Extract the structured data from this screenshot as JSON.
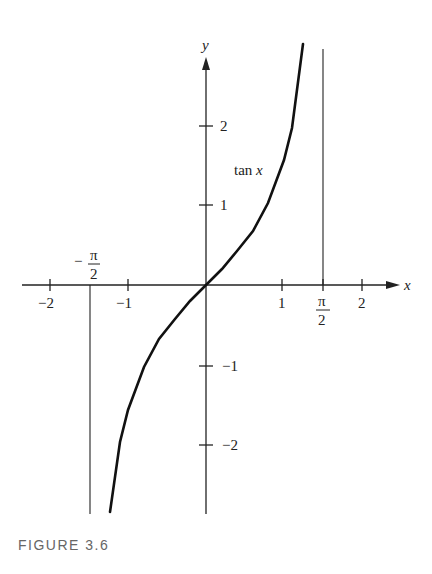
{
  "caption": "FIGURE 3.6",
  "axes": {
    "x_label": "x",
    "y_label": "y",
    "x_ticks": [
      {
        "value": -2,
        "label": "−2"
      },
      {
        "value": -1,
        "label": "−1"
      },
      {
        "value": 1,
        "label": "1"
      },
      {
        "value": 2,
        "label": "2"
      }
    ],
    "y_ticks": [
      {
        "value": 2,
        "label": "2"
      },
      {
        "value": 1,
        "label": "1"
      },
      {
        "value": -1,
        "label": "−1"
      },
      {
        "value": -2,
        "label": "−2"
      }
    ],
    "pi_half_num": "π",
    "pi_half_den": "2",
    "neg_sign": "−"
  },
  "curve_label": "tan x",
  "chart_data": {
    "type": "line",
    "title": "",
    "caption": "FIGURE 3.6",
    "xlabel": "x",
    "ylabel": "y",
    "xlim": [
      -2.5,
      2.5
    ],
    "ylim": [
      -2.85,
      3.0
    ],
    "grid": false,
    "series": [
      {
        "name": "tan x",
        "x": [
          -1.23,
          -1.1,
          -1.0,
          -0.8,
          -0.6,
          -0.4,
          -0.2,
          0,
          0.2,
          0.4,
          0.6,
          0.8,
          1.0,
          1.1,
          1.25
        ],
        "values": [
          -2.82,
          -1.96,
          -1.56,
          -1.03,
          -0.68,
          -0.42,
          -0.2,
          0,
          0.2,
          0.42,
          0.68,
          1.03,
          1.56,
          1.96,
          3.01
        ]
      }
    ],
    "asymptotes": [
      {
        "x": -1.5708,
        "label": "−π/2"
      },
      {
        "x": 1.5708,
        "label": "π/2"
      }
    ],
    "x_tick_labels": [
      "−2",
      "−1",
      "1",
      "π/2",
      "2"
    ],
    "y_tick_labels": [
      "2",
      "1",
      "−1",
      "−2"
    ]
  }
}
